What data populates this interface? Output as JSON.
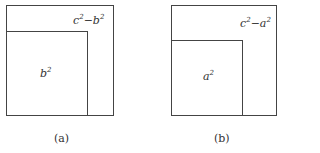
{
  "figures": [
    {
      "caption": "(a)",
      "inner_label": {
        "base": "b",
        "exp": "2"
      },
      "corner_label": {
        "a": "c",
        "a_exp": "2",
        "op": "−",
        "b": "b",
        "b_exp": "2"
      }
    },
    {
      "caption": "(b)",
      "inner_label": {
        "base": "a",
        "exp": "2"
      },
      "corner_label": {
        "a": "c",
        "a_exp": "2",
        "op": "−",
        "b": "a",
        "b_exp": "2"
      }
    }
  ]
}
